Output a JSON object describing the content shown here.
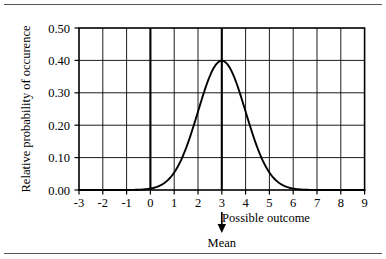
{
  "chart_data": {
    "type": "line",
    "title": "",
    "xlabel": "Possible outcome",
    "ylabel": "Relative probability of occurence",
    "xlim": [
      -3,
      9
    ],
    "ylim": [
      0.0,
      0.5
    ],
    "xticks": [
      "-3",
      "-2",
      "-1",
      "0",
      "1",
      "2",
      "3",
      "4",
      "5",
      "6",
      "7",
      "8",
      "9"
    ],
    "yticks": [
      "0.50",
      "0.40",
      "0.30",
      "0.20",
      "0.10",
      "0.00"
    ],
    "ytick_values": [
      0.5,
      0.4,
      0.3,
      0.2,
      0.1,
      0.0
    ],
    "grid": true,
    "grid_x_values": [
      -3,
      -2,
      -1,
      0,
      1,
      2,
      3,
      4,
      5,
      6,
      7,
      8,
      9
    ],
    "grid_y_values": [
      0.1,
      0.2,
      0.3,
      0.4
    ],
    "emphasized_x_gridlines": [
      0,
      3
    ],
    "legend": "none",
    "annotations": [
      {
        "name": "mean-marker",
        "label": "Mean",
        "x": 3,
        "arrow": "down"
      }
    ],
    "series": [
      {
        "name": "normal distribution (mean 3, sd 1)",
        "mean": 3,
        "sd": 1,
        "peak_value": 0.399,
        "x": [
          -3,
          -2.5,
          -2,
          -1.5,
          -1,
          -0.5,
          0,
          0.5,
          1,
          1.5,
          2,
          2.5,
          3,
          3.5,
          4,
          4.5,
          5,
          5.5,
          6,
          6.5,
          7,
          7.5,
          8,
          8.5,
          9
        ],
        "values": [
          0.0,
          0.0,
          0.0,
          0.0,
          0.0,
          0.002,
          0.004,
          0.018,
          0.054,
          0.13,
          0.242,
          0.352,
          0.399,
          0.352,
          0.242,
          0.13,
          0.054,
          0.018,
          0.004,
          0.002,
          0.0,
          0.0,
          0.0,
          0.0,
          0.0
        ]
      }
    ]
  },
  "figure": {
    "rule_top": "",
    "rule_bottom": ""
  }
}
